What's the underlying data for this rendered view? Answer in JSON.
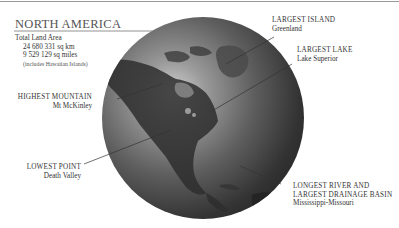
{
  "header": {
    "title": "NORTH AMERICA",
    "land_area_label": "Total Land Area",
    "land_area_km": "24 680 331 sq km",
    "land_area_miles": "9 529 129 sq miles",
    "land_area_note": "(includes Hawaiian Islands)"
  },
  "callouts": {
    "largest_island": {
      "heading": "LARGEST ISLAND",
      "value": "Greenland"
    },
    "largest_lake": {
      "heading": "LARGEST LAKE",
      "value": "Lake Superior"
    },
    "highest_mountain": {
      "heading": "HIGHEST MOUNTAIN",
      "value": "Mt McKinley"
    },
    "lowest_point": {
      "heading": "LOWEST POINT",
      "value": "Death Valley"
    },
    "longest_river": {
      "heading_line1": "LONGEST RIVER AND",
      "heading_line2": "LARGEST DRAINAGE BASIN",
      "value": "Mississippi-Missouri"
    }
  },
  "colors": {
    "globe_light": "#d2d2d2",
    "globe_dark": "#1a1a1a",
    "text": "#333333",
    "rule": "#777777"
  }
}
